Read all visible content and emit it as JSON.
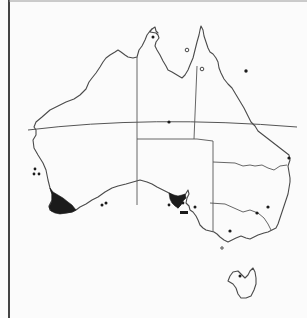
{
  "map": {
    "type": "species distribution map",
    "region": "Australia",
    "width": 307,
    "height": 318,
    "colors": {
      "background": "#fbfbfb",
      "coastline": "#4a4a4a",
      "borders": "#555555",
      "range_fill": "#1b1b1b",
      "frame": "#444444"
    },
    "frame": {
      "left_x": 9,
      "top_y": 1
    },
    "mainland_coastline": "M36,130 L34,127 L36,122 L42,117 L50,110 L58,106 L66,102 L74,99 L80,95 L86,89 L89,82 L92,78 L96,73 L100,67 L103,62 L106,58 L110,55 L115,52 L118,50 L121,52 L125,55 L128,57 L133,58 L137,57 L139,50 L142,46 L145,40 L147,35 L150,31 L152,29 L150,32 L156,33 L158,35 L159,38 L156,42 L155,46 L157,50 L160,55 L163,61 L166,66 L168,70 L172,72 L177,75 L182,78 L185,75 L188,70 L190,65 L193,58 L195,50 L197,42 L199,35 L200,30 L201,26 L203,30 L204,36 L206,42 L208,48 L210,52 L213,54 L216,58 L218,62 L219,68 L221,73 L224,79 L228,84 L232,88 L235,93 L238,98 L241,103 L244,108 L247,114 L249,118 L251,122 L255,126 L258,131 L289,155 L290,160 L288,166 L289,172 L290,178 L290,182 L289,188 L288,194 L286,200 L284,206 L282,212 L280,218 L278,224 L276,228 L272,230 L268,232 L264,233 L258,235 L254,237 L250,239 L246,238 L241,236 L236,238 L232,240 L228,242 L224,240 L220,237 L217,234 L214,232 L210,231 L206,230 L203,228 L200,225 L198,220 L196,216 L193,212 L190,210 L189,206 L186,203 L187,198 L189,194 L188,190 L185,195 L183,198 L181,204 L178,208 L176,204 L177,200 L174,196 L169,193 L163,190 L157,187 L152,184 L147,182 L140,180 L133,182 L126,184 L118,186 L112,188 L105,192 L98,197 L92,200 L86,204 L80,207 L76,210 L72,212 L66,213 L60,213 L55,212 L50,210 L49,206 L52,200 L52,194 L50,188 L48,180 L46,170 L43,163 L38,155 L34,148 L33,140 L36,135 Z",
    "cape_york_detail": "M152,29 L155,27 L156,31 L158,33",
    "tasmania_coastline": "M228,281 L230,276 L233,272 L238,271 L242,275 L245,278 L248,275 L250,271 L253,268 L255,272 L256,278 L256,284 L254,290 L251,296 L246,298 L241,298 L238,294 L236,288 L233,284 Z",
    "state_borders": [
      {
        "name": "wa-nt-sa-border",
        "d": "M137,57 L137,205"
      },
      {
        "name": "nt-sa-border",
        "d": "M137,139 L197,139"
      },
      {
        "name": "nt-qld-border",
        "d": "M197,66 L194,139"
      },
      {
        "name": "sa-qld-nsw-border",
        "d": "M213,141 L213,232"
      },
      {
        "name": "sa-qld-border",
        "d": "M197,139 L213,141"
      },
      {
        "name": "qld-nsw-border",
        "d": "M213,162 L235,163 L243,166 L250,165 L255,166 L262,165 L268,168 L274,170 L280,166 L287,165"
      },
      {
        "name": "nsw-vic-border",
        "d": "M210,203 L225,204 L234,208 L243,212 L250,210 L258,213 L264,218 L268,224 L271,230"
      }
    ],
    "tropic_of_capricorn": "M28,130 Q150,115 297,127",
    "distribution_areas": [
      {
        "name": "south-west-western-australia",
        "d": "M50,188 L53,192 L58,195 L63,198 L68,202 L72,205 L76,210 L72,212 L66,213 L60,214 L55,213 L51,211 L49,207 L52,201 L52,194 Z"
      },
      {
        "name": "south-australia-gulf-region",
        "d": "M169,193 L174,195 L178,196 L182,195 L185,194 L186,198 L183,201 L181,205 L178,208 L175,206 L172,203 L170,199 Z"
      }
    ],
    "localities": [
      {
        "kind": "dot",
        "x": 35,
        "y": 169,
        "r": 1.4
      },
      {
        "kind": "dot",
        "x": 34,
        "y": 174,
        "r": 1.4
      },
      {
        "kind": "dot",
        "x": 39,
        "y": 174,
        "r": 1.4
      },
      {
        "kind": "dot",
        "x": 102,
        "y": 205,
        "r": 1.5
      },
      {
        "kind": "dot",
        "x": 106,
        "y": 203,
        "r": 1.5
      },
      {
        "kind": "dot",
        "x": 169,
        "y": 205,
        "r": 1.4
      },
      {
        "kind": "dot",
        "x": 183,
        "y": 203,
        "r": 1.4
      },
      {
        "kind": "dot",
        "x": 195,
        "y": 207,
        "r": 1.5
      },
      {
        "kind": "dot",
        "x": 230,
        "y": 231,
        "r": 1.6
      },
      {
        "kind": "dot",
        "x": 257,
        "y": 213,
        "r": 1.6
      },
      {
        "kind": "dot",
        "x": 268,
        "y": 207,
        "r": 1.6
      },
      {
        "kind": "dot",
        "x": 246,
        "y": 71,
        "r": 1.7
      },
      {
        "kind": "dot",
        "x": 169,
        "y": 122,
        "r": 1.6
      },
      {
        "kind": "dot",
        "x": 289,
        "y": 158,
        "r": 1.6
      },
      {
        "kind": "dot",
        "x": 240,
        "y": 276,
        "r": 1.5
      },
      {
        "kind": "dot",
        "x": 153,
        "y": 37,
        "r": 1.5
      },
      {
        "kind": "ring",
        "x": 187,
        "y": 50,
        "r": 1.8
      },
      {
        "kind": "ring",
        "x": 202,
        "y": 69,
        "r": 1.8
      },
      {
        "kind": "ring",
        "x": 222,
        "y": 248,
        "r": 1.2
      }
    ],
    "sa-bar": {
      "x": 180,
      "y": 211,
      "w": 8,
      "h": 3
    }
  }
}
